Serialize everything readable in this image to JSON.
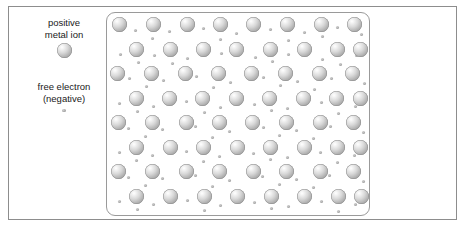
{
  "figure": {
    "width": 465,
    "height": 229,
    "background_color": "#ffffff",
    "frame_border_color": "#8d8d8d",
    "lattice_border_color": "#9a9a9a"
  },
  "legend": {
    "ion": {
      "caption": "positive\nmetal ion",
      "swatch_icon": "metal-ion-sphere-icon",
      "color": "#b4b4b4"
    },
    "electron": {
      "caption": "free electron\n(negative)",
      "swatch_icon": "free-electron-dot-icon",
      "color": "#a8a8a8"
    }
  },
  "lattice": {
    "rows": 8,
    "columns_per_row": 8,
    "ion_diameter_px": 15,
    "electron_diameter_px": 3.4,
    "row_offset_pattern": "alternating",
    "ions": [
      {
        "x": 5,
        "y": 4
      },
      {
        "x": 39,
        "y": 4
      },
      {
        "x": 73,
        "y": 4
      },
      {
        "x": 106,
        "y": 4
      },
      {
        "x": 139,
        "y": 4
      },
      {
        "x": 173,
        "y": 4
      },
      {
        "x": 207,
        "y": 4
      },
      {
        "x": 240,
        "y": 4
      },
      {
        "x": 22,
        "y": 29
      },
      {
        "x": 56,
        "y": 29
      },
      {
        "x": 89,
        "y": 29
      },
      {
        "x": 122,
        "y": 29
      },
      {
        "x": 156,
        "y": 29
      },
      {
        "x": 190,
        "y": 29
      },
      {
        "x": 223,
        "y": 29
      },
      {
        "x": 246,
        "y": 29
      },
      {
        "x": 3,
        "y": 53
      },
      {
        "x": 37,
        "y": 53
      },
      {
        "x": 71,
        "y": 53
      },
      {
        "x": 104,
        "y": 53
      },
      {
        "x": 137,
        "y": 53
      },
      {
        "x": 171,
        "y": 53
      },
      {
        "x": 205,
        "y": 53
      },
      {
        "x": 238,
        "y": 53
      },
      {
        "x": 22,
        "y": 78
      },
      {
        "x": 55,
        "y": 78
      },
      {
        "x": 88,
        "y": 78
      },
      {
        "x": 122,
        "y": 78
      },
      {
        "x": 155,
        "y": 78
      },
      {
        "x": 189,
        "y": 78
      },
      {
        "x": 222,
        "y": 78
      },
      {
        "x": 246,
        "y": 78
      },
      {
        "x": 4,
        "y": 102
      },
      {
        "x": 38,
        "y": 102
      },
      {
        "x": 72,
        "y": 102
      },
      {
        "x": 105,
        "y": 102
      },
      {
        "x": 138,
        "y": 102
      },
      {
        "x": 172,
        "y": 102
      },
      {
        "x": 206,
        "y": 102
      },
      {
        "x": 239,
        "y": 102
      },
      {
        "x": 22,
        "y": 127
      },
      {
        "x": 56,
        "y": 127
      },
      {
        "x": 89,
        "y": 127
      },
      {
        "x": 123,
        "y": 127
      },
      {
        "x": 156,
        "y": 127
      },
      {
        "x": 190,
        "y": 127
      },
      {
        "x": 223,
        "y": 127
      },
      {
        "x": 246,
        "y": 127
      },
      {
        "x": 4,
        "y": 151
      },
      {
        "x": 38,
        "y": 151
      },
      {
        "x": 72,
        "y": 151
      },
      {
        "x": 105,
        "y": 151
      },
      {
        "x": 139,
        "y": 151
      },
      {
        "x": 172,
        "y": 151
      },
      {
        "x": 206,
        "y": 151
      },
      {
        "x": 239,
        "y": 151
      },
      {
        "x": 22,
        "y": 176
      },
      {
        "x": 56,
        "y": 176
      },
      {
        "x": 90,
        "y": 176
      },
      {
        "x": 123,
        "y": 176
      },
      {
        "x": 157,
        "y": 176
      },
      {
        "x": 190,
        "y": 176
      },
      {
        "x": 224,
        "y": 176
      },
      {
        "x": 247,
        "y": 176
      }
    ],
    "electrons": [
      {
        "x": 27,
        "y": 16
      },
      {
        "x": 61,
        "y": 17
      },
      {
        "x": 95,
        "y": 14
      },
      {
        "x": 128,
        "y": 19
      },
      {
        "x": 162,
        "y": 15
      },
      {
        "x": 196,
        "y": 18
      },
      {
        "x": 229,
        "y": 13
      },
      {
        "x": 253,
        "y": 20
      },
      {
        "x": 44,
        "y": 24
      },
      {
        "x": 112,
        "y": 25
      },
      {
        "x": 180,
        "y": 26
      },
      {
        "x": 214,
        "y": 22
      },
      {
        "x": 12,
        "y": 40
      },
      {
        "x": 46,
        "y": 41
      },
      {
        "x": 79,
        "y": 44
      },
      {
        "x": 113,
        "y": 39
      },
      {
        "x": 147,
        "y": 43
      },
      {
        "x": 180,
        "y": 40
      },
      {
        "x": 214,
        "y": 45
      },
      {
        "x": 248,
        "y": 41
      },
      {
        "x": 30,
        "y": 48
      },
      {
        "x": 64,
        "y": 49
      },
      {
        "x": 164,
        "y": 47
      },
      {
        "x": 232,
        "y": 50
      },
      {
        "x": 21,
        "y": 64
      },
      {
        "x": 55,
        "y": 66
      },
      {
        "x": 88,
        "y": 62
      },
      {
        "x": 122,
        "y": 68
      },
      {
        "x": 155,
        "y": 63
      },
      {
        "x": 189,
        "y": 67
      },
      {
        "x": 223,
        "y": 64
      },
      {
        "x": 256,
        "y": 69
      },
      {
        "x": 38,
        "y": 72
      },
      {
        "x": 105,
        "y": 73
      },
      {
        "x": 172,
        "y": 71
      },
      {
        "x": 206,
        "y": 75
      },
      {
        "x": 11,
        "y": 89
      },
      {
        "x": 45,
        "y": 92
      },
      {
        "x": 78,
        "y": 87
      },
      {
        "x": 112,
        "y": 93
      },
      {
        "x": 146,
        "y": 90
      },
      {
        "x": 179,
        "y": 94
      },
      {
        "x": 213,
        "y": 88
      },
      {
        "x": 247,
        "y": 92
      },
      {
        "x": 29,
        "y": 97
      },
      {
        "x": 96,
        "y": 98
      },
      {
        "x": 163,
        "y": 96
      },
      {
        "x": 230,
        "y": 99
      },
      {
        "x": 20,
        "y": 114
      },
      {
        "x": 54,
        "y": 115
      },
      {
        "x": 87,
        "y": 112
      },
      {
        "x": 121,
        "y": 117
      },
      {
        "x": 155,
        "y": 113
      },
      {
        "x": 188,
        "y": 116
      },
      {
        "x": 222,
        "y": 112
      },
      {
        "x": 255,
        "y": 118
      },
      {
        "x": 37,
        "y": 122
      },
      {
        "x": 104,
        "y": 123
      },
      {
        "x": 171,
        "y": 121
      },
      {
        "x": 205,
        "y": 124
      },
      {
        "x": 11,
        "y": 138
      },
      {
        "x": 44,
        "y": 141
      },
      {
        "x": 78,
        "y": 137
      },
      {
        "x": 111,
        "y": 142
      },
      {
        "x": 145,
        "y": 139
      },
      {
        "x": 179,
        "y": 143
      },
      {
        "x": 212,
        "y": 138
      },
      {
        "x": 246,
        "y": 141
      },
      {
        "x": 28,
        "y": 146
      },
      {
        "x": 95,
        "y": 147
      },
      {
        "x": 162,
        "y": 145
      },
      {
        "x": 229,
        "y": 148
      },
      {
        "x": 20,
        "y": 163
      },
      {
        "x": 54,
        "y": 164
      },
      {
        "x": 87,
        "y": 161
      },
      {
        "x": 121,
        "y": 166
      },
      {
        "x": 154,
        "y": 162
      },
      {
        "x": 188,
        "y": 165
      },
      {
        "x": 221,
        "y": 161
      },
      {
        "x": 255,
        "y": 167
      },
      {
        "x": 37,
        "y": 171
      },
      {
        "x": 104,
        "y": 172
      },
      {
        "x": 171,
        "y": 170
      },
      {
        "x": 205,
        "y": 173
      },
      {
        "x": 11,
        "y": 187
      },
      {
        "x": 45,
        "y": 190
      },
      {
        "x": 79,
        "y": 186
      },
      {
        "x": 112,
        "y": 191
      },
      {
        "x": 146,
        "y": 188
      },
      {
        "x": 180,
        "y": 192
      },
      {
        "x": 213,
        "y": 187
      },
      {
        "x": 247,
        "y": 190
      },
      {
        "x": 29,
        "y": 195
      },
      {
        "x": 96,
        "y": 196
      },
      {
        "x": 163,
        "y": 194
      },
      {
        "x": 230,
        "y": 197
      }
    ]
  }
}
